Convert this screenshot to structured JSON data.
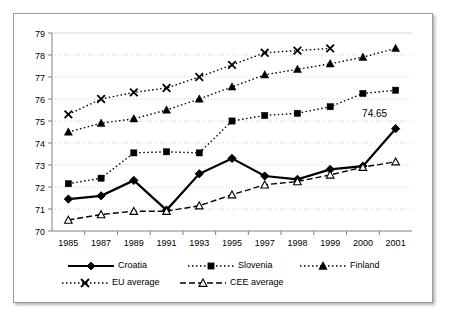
{
  "chart_data": {
    "type": "line",
    "title": "",
    "subtitle": "",
    "xlabel": "",
    "ylabel": "",
    "categories": [
      "1985",
      "1987",
      "1989",
      "1991",
      "1993",
      "1995",
      "1997",
      "1998",
      "1999",
      "2000",
      "2001"
    ],
    "ylim": [
      70,
      79
    ],
    "yticks": [
      "70",
      "71",
      "72",
      "73",
      "74",
      "75",
      "76",
      "77",
      "78",
      "79"
    ],
    "grid": true,
    "legend_position": "bottom",
    "annotations": [
      {
        "text": "74.65",
        "series": "Croatia",
        "category": "2001",
        "value": 74.65
      }
    ],
    "series": [
      {
        "name": "Croatia",
        "marker": "diamond-filled",
        "line_style": "solid",
        "color": "#000000",
        "values": [
          71.45,
          71.6,
          72.3,
          70.95,
          72.6,
          73.3,
          72.5,
          72.35,
          72.8,
          72.95,
          74.65
        ]
      },
      {
        "name": "Slovenia",
        "marker": "square-filled",
        "line_style": "dotted",
        "color": "#000000",
        "values": [
          72.15,
          72.4,
          73.55,
          73.6,
          73.55,
          75.0,
          75.25,
          75.35,
          75.65,
          76.25,
          76.4
        ]
      },
      {
        "name": "Finland",
        "marker": "triangle-filled",
        "line_style": "dotted",
        "color": "#000000",
        "values": [
          74.5,
          74.9,
          75.1,
          75.5,
          76.0,
          76.55,
          77.1,
          77.35,
          77.6,
          77.9,
          78.3
        ]
      },
      {
        "name": "EU average",
        "marker": "cross-x",
        "line_style": "dotted",
        "color": "#000000",
        "values": [
          75.3,
          76.0,
          76.3,
          76.5,
          77.0,
          77.55,
          78.1,
          78.2,
          78.3,
          null,
          null
        ]
      },
      {
        "name": "CEE average",
        "marker": "triangle-open",
        "line_style": "dashed",
        "color": "#000000",
        "values": [
          70.5,
          70.75,
          70.9,
          70.9,
          71.15,
          71.65,
          72.1,
          72.25,
          72.55,
          72.9,
          73.15
        ]
      }
    ],
    "legend": [
      {
        "label": "Croatia",
        "marker": "diamond-filled",
        "line_style": "solid"
      },
      {
        "label": "Slovenia",
        "marker": "square-filled",
        "line_style": "dotted"
      },
      {
        "label": "Finland",
        "marker": "triangle-filled",
        "line_style": "dotted"
      },
      {
        "label": "EU average",
        "marker": "cross-x",
        "line_style": "dotted"
      },
      {
        "label": "CEE average",
        "marker": "triangle-open",
        "line_style": "dashed"
      }
    ]
  }
}
